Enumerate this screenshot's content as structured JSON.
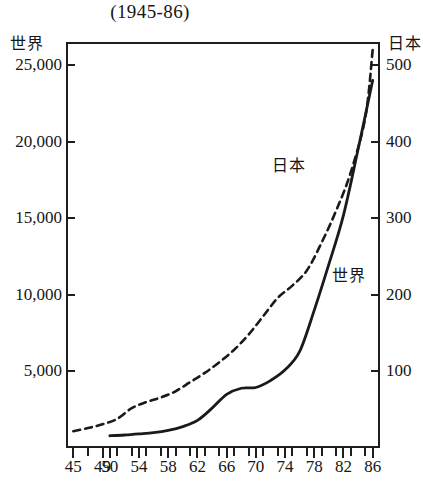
{
  "chart_data": {
    "type": "line",
    "title": "(1945-86)",
    "xlabel": "",
    "ylabel": "世界",
    "y2label": "日本",
    "grid": false,
    "legend_position": "inline-annotation",
    "x": [
      45,
      46,
      47,
      48,
      49,
      50,
      51,
      52,
      53,
      54,
      55,
      56,
      57,
      58,
      59,
      60,
      61,
      62,
      63,
      64,
      65,
      66,
      67,
      68,
      69,
      70,
      71,
      72,
      73,
      74,
      75,
      76,
      77,
      78,
      79,
      80,
      81,
      82,
      83,
      84,
      85,
      86
    ],
    "xtick_labels": [
      "45",
      "49",
      "50",
      "54",
      "58",
      "62",
      "66",
      "70",
      "74",
      "78",
      "82",
      "86"
    ],
    "xtick_values": [
      45,
      49,
      50,
      54,
      58,
      62,
      66,
      70,
      74,
      78,
      82,
      86
    ],
    "xlim": [
      44,
      87
    ],
    "ylim": [
      0,
      26500
    ],
    "y2lim": [
      0,
      530
    ],
    "ytick_labels": [
      "5,000",
      "10,000",
      "15,000",
      "20,000",
      "25,000"
    ],
    "ytick_values": [
      5000,
      10000,
      15000,
      20000,
      25000
    ],
    "y2tick_labels": [
      "100",
      "200",
      "300",
      "400",
      "500"
    ],
    "y2tick_values": [
      100,
      200,
      300,
      400,
      500
    ],
    "series": [
      {
        "name": "日本",
        "axis": "right",
        "style": "dashed",
        "annotation": "日本",
        "x": [
          45,
          47,
          49,
          51,
          53,
          55,
          57,
          59,
          61,
          63,
          65,
          67,
          69,
          71,
          73,
          75,
          77,
          79,
          81,
          83,
          85,
          86
        ],
        "values": [
          22,
          26,
          31,
          38,
          52,
          60,
          66,
          74,
          86,
          98,
          112,
          128,
          148,
          172,
          196,
          212,
          232,
          268,
          310,
          360,
          432,
          520
        ]
      },
      {
        "name": "世界",
        "axis": "left",
        "style": "solid",
        "annotation": "世界",
        "x": [
          50,
          52,
          54,
          56,
          58,
          60,
          62,
          64,
          66,
          68,
          70,
          72,
          74,
          76,
          78,
          80,
          82,
          84,
          86
        ],
        "values": [
          800,
          850,
          920,
          1000,
          1150,
          1400,
          1800,
          2600,
          3500,
          3900,
          3950,
          4400,
          5100,
          6300,
          9000,
          12000,
          15200,
          19500,
          24000
        ]
      }
    ]
  }
}
